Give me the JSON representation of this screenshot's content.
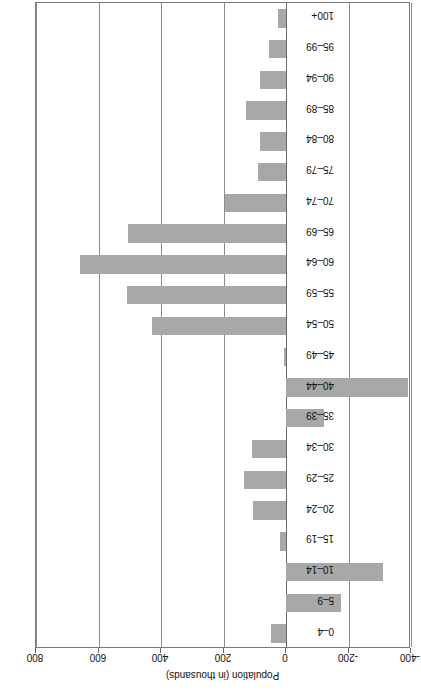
{
  "chart_data": {
    "type": "bar",
    "orientation": "horizontal-rotated",
    "title": "Change in Canadian Population, by Age Groups, 2004 to 2014",
    "xlabel": "Population (in thousands)",
    "ylabel": "",
    "value_axis_label": "Population (in thousands)",
    "value_axis_ticks": [
      800,
      600,
      400,
      200,
      0,
      -200,
      -400
    ],
    "value_axis_tick_labels": [
      "800",
      "600",
      "400",
      "200",
      "0",
      "-200",
      "-400"
    ],
    "xlim": [
      800,
      -400
    ],
    "grid": true,
    "legend": "none",
    "bar_color": "#a8a8a8",
    "categories": [
      "100+",
      "95–99",
      "90–94",
      "85–89",
      "80–84",
      "75–79",
      "70–74",
      "65–69",
      "60–64",
      "55–59",
      "50–54",
      "45–49",
      "40–44",
      "35–39",
      "30–34",
      "25–29",
      "20–24",
      "15–19",
      "10–14",
      "5–9",
      "0–4"
    ],
    "values": [
      25,
      55,
      82,
      128,
      82,
      90,
      195,
      505,
      660,
      510,
      430,
      5,
      -390,
      -120,
      110,
      135,
      107,
      20,
      -310,
      -175,
      48
    ]
  }
}
